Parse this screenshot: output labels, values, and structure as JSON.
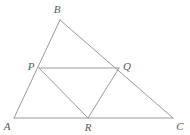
{
  "figure": {
    "kind": "geometry-diagram",
    "background_color": "#ffffff",
    "line_color": "#9a9a9a",
    "line_width": 1,
    "label_color": "#5a5a5a",
    "canvas": {
      "width": 190,
      "height": 135
    },
    "points": [
      {
        "id": "A",
        "label": "A",
        "x": 14,
        "y": 118,
        "label_x": 7,
        "label_y": 126
      },
      {
        "id": "B",
        "label": "B",
        "x": 60,
        "y": 20,
        "label_x": 57,
        "label_y": 9
      },
      {
        "id": "C",
        "label": "C",
        "x": 173,
        "y": 118,
        "label_x": 180,
        "label_y": 126
      },
      {
        "id": "P",
        "label": "P",
        "x": 39,
        "y": 68,
        "label_x": 31,
        "label_y": 66
      },
      {
        "id": "Q",
        "label": "Q",
        "x": 119,
        "y": 68,
        "label_x": 127,
        "label_y": 66
      },
      {
        "id": "R",
        "label": "R",
        "x": 88,
        "y": 118,
        "label_x": 88,
        "label_y": 127
      }
    ],
    "segments": [
      {
        "id": "AB",
        "from": "A",
        "to": "B",
        "x1": 14,
        "y1": 118,
        "x2": 60,
        "y2": 20
      },
      {
        "id": "BC",
        "from": "B",
        "to": "C",
        "x1": 60,
        "y1": 20,
        "x2": 173,
        "y2": 118
      },
      {
        "id": "AC",
        "from": "A",
        "to": "C",
        "x1": 14,
        "y1": 118,
        "x2": 173,
        "y2": 118
      },
      {
        "id": "PQ",
        "from": "P",
        "to": "Q",
        "x1": 39,
        "y1": 68,
        "x2": 119,
        "y2": 68
      },
      {
        "id": "PR",
        "from": "P",
        "to": "R",
        "x1": 39,
        "y1": 68,
        "x2": 88,
        "y2": 118
      },
      {
        "id": "QR",
        "from": "Q",
        "to": "R",
        "x1": 119,
        "y1": 68,
        "x2": 88,
        "y2": 118
      }
    ]
  }
}
